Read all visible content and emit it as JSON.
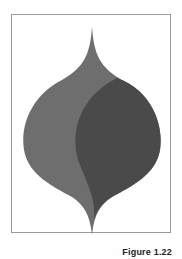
{
  "figure": {
    "caption": "Figure 1.22",
    "colors": {
      "left_shape": "#6e6e6e",
      "right_shape": "#4a4a4a",
      "border": "#9a9a9a",
      "background": "#ffffff"
    }
  }
}
